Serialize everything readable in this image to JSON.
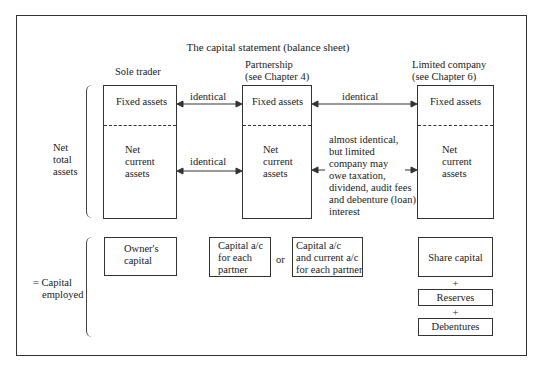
{
  "title": "The capital statement (balance sheet)",
  "columns": {
    "sole_trader": {
      "heading": "Sole trader"
    },
    "partnership": {
      "heading_line1": "Partnership",
      "heading_line2": "(see Chapter 4)"
    },
    "limited": {
      "heading_line1": "Limited company",
      "heading_line2": "(see Chapter 6)"
    }
  },
  "asset_boxes": {
    "fixed_assets": "Fixed assets",
    "net_current_line1": "Net",
    "net_current_line2": "current",
    "net_current_line3": "assets"
  },
  "arrows": {
    "fixed_st_pt": "identical",
    "fixed_pt_ltd": "identical",
    "ncа_st_pt": "identical",
    "nca_pt_ltd": [
      "almost identical,",
      "but limited",
      "company may",
      "owe taxation,",
      "dividend, audit fees",
      "and debenture (loan)",
      "interest"
    ]
  },
  "left_labels": {
    "net_total_assets": [
      "Net",
      "total",
      "assets"
    ],
    "capital_employed": [
      "= Capital",
      "employed"
    ]
  },
  "capital": {
    "sole_trader": [
      "Owner's",
      "capital"
    ],
    "partnership_a": [
      "Capital a/c",
      "for each",
      "partner"
    ],
    "or": "or",
    "partnership_b": [
      "Capital a/c",
      "and current a/c",
      "for each partner"
    ],
    "limited_share": "Share capital",
    "plus": "+",
    "limited_reserves": "Reserves",
    "limited_debentures": "Debentures"
  }
}
